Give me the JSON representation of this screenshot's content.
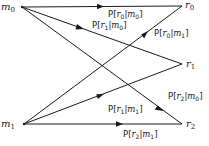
{
  "diagram": {
    "type": "binary-channel-transition-diagram",
    "inputs": [
      {
        "id": "m0",
        "base": "m",
        "sub": "0",
        "x": 22,
        "y": 7
      },
      {
        "id": "m1",
        "base": "m",
        "sub": "1",
        "x": 24,
        "y": 124
      }
    ],
    "outputs": [
      {
        "id": "r0",
        "base": "r",
        "sub": "0",
        "x": 182,
        "y": 6
      },
      {
        "id": "r1",
        "base": "r",
        "sub": "1",
        "x": 182,
        "y": 64
      },
      {
        "id": "r2",
        "base": "r",
        "sub": "2",
        "x": 182,
        "y": 124
      }
    ],
    "edges": [
      {
        "from": "m0",
        "to": "r0",
        "label": "P[r0|m0]",
        "r": "0",
        "m": "0"
      },
      {
        "from": "m0",
        "to": "r1",
        "label": "P[r1|m0]",
        "r": "1",
        "m": "0"
      },
      {
        "from": "m0",
        "to": "r2",
        "label": "P[r2|m0]",
        "r": "2",
        "m": "0"
      },
      {
        "from": "m1",
        "to": "r0",
        "label": "P[r0|m1]",
        "r": "0",
        "m": "1"
      },
      {
        "from": "m1",
        "to": "r1",
        "label": "P[r1|m1]",
        "r": "1",
        "m": "1"
      },
      {
        "from": "m1",
        "to": "r2",
        "label": "P[r2|m1]",
        "r": "2",
        "m": "1"
      }
    ]
  },
  "labels": {
    "m0_base": "m",
    "m0_sub": "0",
    "m1_base": "m",
    "m1_sub": "1",
    "r0_base": "r",
    "r0_sub": "0",
    "r1_base": "r",
    "r1_sub": "1",
    "r2_base": "r",
    "r2_sub": "2",
    "P": "P",
    "open": "[",
    "bar": "|",
    "close": "]",
    "e_r0m0": {
      "r": "0",
      "m": "0"
    },
    "e_r1m0": {
      "r": "1",
      "m": "0"
    },
    "e_r2m0": {
      "r": "2",
      "m": "0"
    },
    "e_r0m1": {
      "r": "0",
      "m": "1"
    },
    "e_r1m1": {
      "r": "1",
      "m": "1"
    },
    "e_r2m1": {
      "r": "2",
      "m": "1"
    }
  }
}
